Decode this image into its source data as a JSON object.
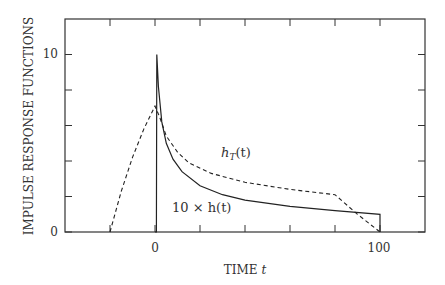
{
  "chart_data": {
    "type": "line",
    "title": "",
    "xlabel": "TIME t",
    "ylabel": "IMPULSE RESPONSE FUNCTIONS",
    "xlim": [
      -40,
      120
    ],
    "ylim": [
      0,
      12
    ],
    "x_ticks": [
      -20,
      0,
      20,
      40,
      60,
      80,
      100
    ],
    "x_tick_labels": {
      "0": "0",
      "100": "100"
    },
    "y_ticks": [
      0,
      2,
      4,
      6,
      8,
      10
    ],
    "y_tick_labels": {
      "0": "0",
      "10": "10"
    },
    "grid": false,
    "series": [
      {
        "name": "10 × h(t)",
        "style": "solid",
        "points": [
          [
            0,
            0
          ],
          [
            0.6,
            0
          ],
          [
            0.8,
            10
          ],
          [
            1.5,
            8.2
          ],
          [
            3,
            6.2
          ],
          [
            5,
            5
          ],
          [
            8,
            4.1
          ],
          [
            12,
            3.4
          ],
          [
            20,
            2.6
          ],
          [
            30,
            2.1
          ],
          [
            40,
            1.8
          ],
          [
            60,
            1.45
          ],
          [
            80,
            1.2
          ],
          [
            100,
            1.0
          ],
          [
            100,
            0
          ]
        ]
      },
      {
        "name": "h_T(t)",
        "style": "dashed",
        "points": [
          [
            -20,
            0
          ],
          [
            -15,
            2.3
          ],
          [
            -10,
            4.2
          ],
          [
            -5,
            5.8
          ],
          [
            0,
            7.1
          ],
          [
            2,
            6.5
          ],
          [
            5,
            5.4
          ],
          [
            10,
            4.5
          ],
          [
            15,
            3.9
          ],
          [
            25,
            3.3
          ],
          [
            40,
            2.8
          ],
          [
            60,
            2.4
          ],
          [
            80,
            2.1
          ],
          [
            90,
            1.0
          ],
          [
            100,
            0
          ]
        ]
      }
    ],
    "annotations": [
      {
        "text": "h_T(t)",
        "x": 30,
        "y": 4.1
      },
      {
        "text": "10 × h(t)",
        "x": 12,
        "y": 0.8
      }
    ]
  },
  "labels": {
    "ylabel": "IMPULSE RESPONSE FUNCTIONS",
    "xlabel_main": "TIME ",
    "xlabel_var": "t",
    "ytick_0": "0",
    "ytick_10": "10",
    "xtick_0": "0",
    "xtick_100": "100",
    "ann_hT_base": "h",
    "ann_hT_sub": "T",
    "ann_hT_arg": "(t)",
    "ann_h": "10 × h(t)"
  }
}
